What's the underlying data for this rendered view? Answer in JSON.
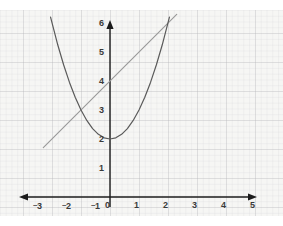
{
  "chart_data": {
    "type": "line",
    "title": "",
    "xlabel": "",
    "ylabel": "",
    "xlim": [
      -3.2,
      5.3
    ],
    "ylim": [
      -0.6,
      6.4
    ],
    "grid": true,
    "grid_minor_per_unit": 5,
    "legend": "none",
    "axes": {
      "x_ticks": [
        -3,
        -2,
        -1,
        0,
        1,
        2,
        3,
        4,
        5
      ],
      "y_ticks": [
        1,
        2,
        3,
        4,
        5,
        6
      ],
      "x_tick_labels": [
        "-3",
        "-2",
        "-1",
        "0",
        "1",
        "2",
        "3",
        "4",
        "5"
      ],
      "y_tick_labels": [
        "1",
        "2",
        "3",
        "4",
        "5",
        "6"
      ],
      "origin_label": "0",
      "x_arrow_both_ends": true,
      "y_arrow_top": true
    },
    "series": [
      {
        "name": "parabola",
        "kind": "parabola",
        "equation": "y = x^2 + 2",
        "vertex": [
          0,
          2
        ],
        "color": "#5a5a5a",
        "width": 1.2,
        "points": [
          [
            -2.05,
            6.2
          ],
          [
            -1.8,
            5.24
          ],
          [
            -1.6,
            4.56
          ],
          [
            -1.4,
            3.96
          ],
          [
            -1.2,
            3.44
          ],
          [
            -1.0,
            3.0
          ],
          [
            -0.8,
            2.64
          ],
          [
            -0.6,
            2.36
          ],
          [
            -0.4,
            2.16
          ],
          [
            -0.2,
            2.04
          ],
          [
            0.0,
            2.0
          ],
          [
            0.2,
            2.04
          ],
          [
            0.4,
            2.16
          ],
          [
            0.6,
            2.36
          ],
          [
            0.8,
            2.64
          ],
          [
            1.0,
            3.0
          ],
          [
            1.2,
            3.44
          ],
          [
            1.4,
            3.96
          ],
          [
            1.6,
            4.56
          ],
          [
            1.8,
            5.24
          ],
          [
            2.05,
            6.2
          ]
        ]
      },
      {
        "name": "line",
        "kind": "line",
        "equation": "y = x + 4",
        "slope": 1,
        "intercept": 4,
        "color": "#9a9a9a",
        "width": 1.2,
        "points": [
          [
            -2.3,
            1.7
          ],
          [
            2.3,
            6.3
          ]
        ]
      }
    ],
    "intersections": [
      [
        -1,
        3
      ],
      [
        2,
        6
      ]
    ]
  },
  "labels": {
    "x": [
      {
        "text": "3",
        "neg": true,
        "x": 33,
        "y": 201
      },
      {
        "text": "2",
        "neg": true,
        "x": 62,
        "y": 201
      },
      {
        "text": "1",
        "neg": true,
        "x": 91,
        "y": 201
      },
      {
        "text": "0",
        "neg": false,
        "x": 105,
        "y": 201
      },
      {
        "text": "1",
        "neg": false,
        "x": 134,
        "y": 201
      },
      {
        "text": "2",
        "neg": false,
        "x": 163,
        "y": 201
      },
      {
        "text": "3",
        "neg": false,
        "x": 192,
        "y": 201
      },
      {
        "text": "4",
        "neg": false,
        "x": 221,
        "y": 201
      },
      {
        "text": "5",
        "neg": false,
        "x": 250,
        "y": 201
      }
    ],
    "y": [
      {
        "text": "1",
        "x": 99,
        "y": 164
      },
      {
        "text": "2",
        "x": 99,
        "y": 135
      },
      {
        "text": "3",
        "x": 99,
        "y": 106
      },
      {
        "text": "4",
        "x": 99,
        "y": 77
      },
      {
        "text": "5",
        "x": 99,
        "y": 48
      },
      {
        "text": "6",
        "x": 99,
        "y": 19
      }
    ]
  },
  "colors": {
    "paper": "#f2f2f0",
    "grid_major": "#96969b",
    "grid_minor": "#aaaaaf",
    "axis": "#1c1c1c",
    "parabola": "#5a5a5a",
    "line": "#9a9a9a",
    "tick_text": "#3a3a3a",
    "page_background": "#ffffff"
  }
}
